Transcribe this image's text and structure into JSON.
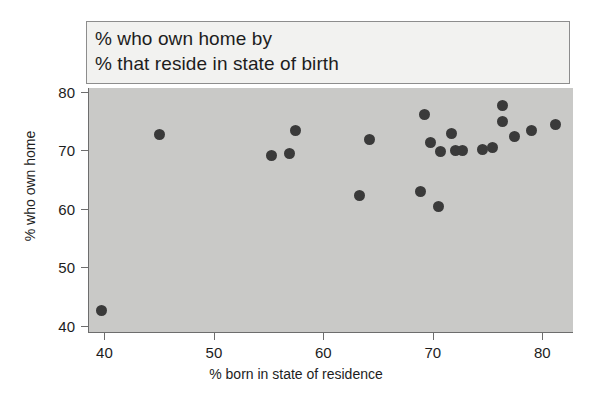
{
  "title": {
    "line1": "% who own home by",
    "line2": "% that reside in state of birth"
  },
  "axes": {
    "x_title": "% born in state of residence",
    "y_title": "% who own home",
    "x_ticks": [
      "40",
      "50",
      "60",
      "70",
      "80"
    ],
    "y_ticks": [
      "40",
      "50",
      "60",
      "70",
      "80"
    ]
  },
  "colors": {
    "panel_background": "#c9c9c7",
    "title_background": "#f2f2f0",
    "marker": "#3a3a3a",
    "axis_line": "#6d6d6d",
    "text": "#1d1d1d"
  },
  "chart_data": {
    "type": "scatter",
    "title": "% who own home by % that reside in state of birth",
    "xlabel": "% born in state of residence",
    "ylabel": "% who own home",
    "xlim": [
      38.5,
      82.8
    ],
    "ylim": [
      38.8,
      80.6
    ],
    "xticks": [
      40,
      50,
      60,
      70,
      80
    ],
    "yticks": [
      40,
      50,
      60,
      70,
      80
    ],
    "grid": false,
    "legend": "none",
    "marker_color": "#3a3a3a",
    "n_points": 24,
    "points": [
      {
        "x": 39.6,
        "y": 42.7
      },
      {
        "x": 44.9,
        "y": 72.6
      },
      {
        "x": 55.2,
        "y": 69.1
      },
      {
        "x": 56.8,
        "y": 69.4
      },
      {
        "x": 57.4,
        "y": 73.4
      },
      {
        "x": 63.2,
        "y": 62.2
      },
      {
        "x": 64.1,
        "y": 71.8
      },
      {
        "x": 68.8,
        "y": 62.9
      },
      {
        "x": 69.1,
        "y": 76.0
      },
      {
        "x": 69.7,
        "y": 71.3
      },
      {
        "x": 70.4,
        "y": 60.3
      },
      {
        "x": 70.6,
        "y": 69.8
      },
      {
        "x": 71.6,
        "y": 72.9
      },
      {
        "x": 72.0,
        "y": 69.9
      },
      {
        "x": 72.6,
        "y": 69.9
      },
      {
        "x": 74.4,
        "y": 70.1
      },
      {
        "x": 75.4,
        "y": 70.4
      },
      {
        "x": 76.3,
        "y": 77.6
      },
      {
        "x": 76.3,
        "y": 74.9
      },
      {
        "x": 77.4,
        "y": 72.4
      },
      {
        "x": 78.9,
        "y": 73.3
      },
      {
        "x": 81.1,
        "y": 74.3
      }
    ]
  }
}
